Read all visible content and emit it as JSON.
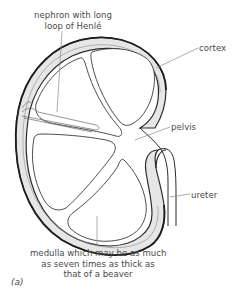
{
  "diagram": {
    "figure_label": "(a)",
    "labels": {
      "nephron_line1": "nephron with long",
      "nephron_line2": "loop of Henlé",
      "cortex": "cortex",
      "pelvis": "pelvis",
      "ureter": "ureter",
      "medulla_line1": "medulla which may be as much",
      "medulla_line2": "as seven times as thick as",
      "medulla_line3": "that of a beaver"
    },
    "colors": {
      "outline": "#2b2b2b",
      "cortex_fill": "#e6e6e6",
      "leader_line": "#8a8a8a",
      "text": "#4a4a4a"
    }
  }
}
